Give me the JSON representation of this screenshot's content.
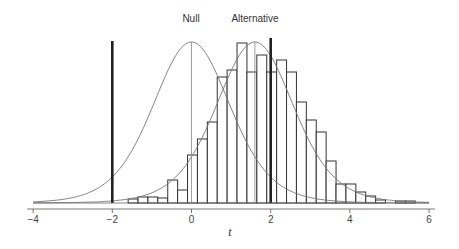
{
  "chart_data": {
    "type": "bar",
    "title": "",
    "xlabel": "t",
    "ylabel": "",
    "xlim": [
      -4,
      6
    ],
    "grid": false,
    "xticks": [
      -4,
      -2,
      0,
      2,
      4,
      6
    ],
    "xtick_labels": [
      "−4",
      "−2",
      "0",
      "2",
      "4",
      "6"
    ],
    "annotations": [
      {
        "text": "Null",
        "x": 0
      },
      {
        "text": "Alternative",
        "x": 1.6
      }
    ],
    "critical_values": [
      -2,
      2
    ],
    "curves": [
      {
        "name": "Null",
        "distribution": "t-density",
        "center": 0,
        "peak_x": 0
      },
      {
        "name": "Alternative",
        "distribution": "t-density",
        "center": 1.6,
        "peak_x": 1.6
      }
    ],
    "histogram": {
      "bin_width": 0.25,
      "bin_starts": [
        -1.6,
        -1.35,
        -1.1,
        -0.85,
        -0.6,
        -0.35,
        -0.1,
        0.15,
        0.4,
        0.65,
        0.9,
        1.15,
        1.4,
        1.65,
        1.9,
        2.15,
        2.4,
        2.65,
        2.9,
        3.15,
        3.4,
        3.65,
        3.9,
        4.15,
        4.4,
        4.65,
        4.9,
        5.15,
        5.4
      ],
      "relative_heights": [
        4,
        6,
        6,
        5,
        23,
        13,
        48,
        64,
        81,
        126,
        133,
        160,
        131,
        148,
        131,
        143,
        131,
        101,
        83,
        71,
        42,
        19,
        19,
        11,
        7,
        3,
        0,
        2,
        2
      ]
    }
  },
  "labels": {
    "null": "Null",
    "alternative": "Alternative",
    "xaxis": "t",
    "ticks": [
      "−4",
      "−2",
      "0",
      "2",
      "4",
      "6"
    ]
  }
}
